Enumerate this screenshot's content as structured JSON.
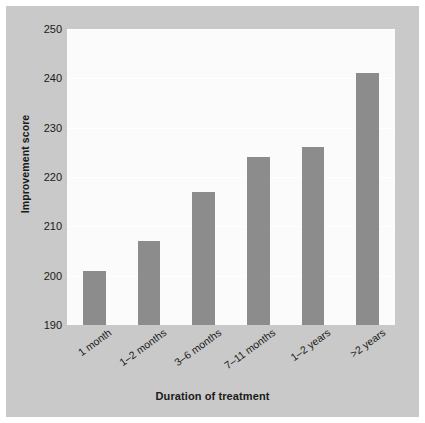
{
  "chart_data": {
    "type": "bar",
    "title": "",
    "subtitle": "",
    "xlabel": "Duration of treatment",
    "ylabel": "Improvement score",
    "categories": [
      "1 month",
      "1–2 months",
      "3–6 months",
      "7–11 months",
      "1–2 years",
      ">2 years"
    ],
    "values": [
      201,
      207,
      217,
      224,
      226,
      241
    ],
    "ylim": [
      190,
      250
    ],
    "yticks": [
      190,
      200,
      210,
      220,
      230,
      240,
      250
    ],
    "ytick_labels": [
      "190",
      "200",
      "210",
      "220",
      "230",
      "240",
      "250"
    ],
    "grid": true,
    "grid_axis": "y",
    "legend": null,
    "legend_position": "none",
    "bar_color": "#8c8c8c",
    "plot_background": "#fbfbfb",
    "figure_background": "#c9c9c9",
    "text_color": "#1a1a1a",
    "gridline_color": "#ffffff",
    "xtick_rotation": -36,
    "annotations": []
  }
}
